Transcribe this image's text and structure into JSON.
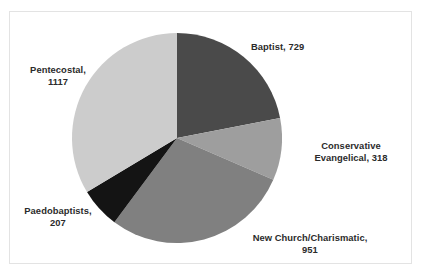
{
  "chart_data": {
    "type": "pie",
    "title": "",
    "subtitle": "",
    "xlabel": "",
    "ylabel": "",
    "legend_position": "none",
    "grid": false,
    "label_format": "{category}, {value}",
    "total": 3322,
    "start_angle_deg": 0,
    "direction": "clockwise",
    "categories": [
      "Baptist",
      "Conservative Evangelical",
      "New Church/Charismatic",
      "Paedobaptists",
      "Pentecostal"
    ],
    "values": [
      729,
      318,
      951,
      207,
      1117
    ],
    "slices": [
      {
        "category": "Baptist",
        "value": 729,
        "label": "Baptist, 729",
        "color": "#4a4a4a",
        "start_angle_deg": 0.0,
        "sweep_angle_deg": 79.0,
        "percent": 21.9
      },
      {
        "category": "Conservative Evangelical",
        "value": 318,
        "label": "Conservative Evangelical, 318",
        "label_line1": "Conservative",
        "label_line2": "Evangelical, 318",
        "color": "#9e9e9e",
        "start_angle_deg": 79.0,
        "sweep_angle_deg": 34.5,
        "percent": 9.6
      },
      {
        "category": "New Church/Charismatic",
        "value": 951,
        "label": "New Church/Charismatic, 951",
        "label_line1": "New Church/Charismatic,",
        "label_line2": "951",
        "color": "#808080",
        "start_angle_deg": 113.5,
        "sweep_angle_deg": 103.1,
        "percent": 28.6
      },
      {
        "category": "Paedobaptists",
        "value": 207,
        "label": "Paedobaptists, 207",
        "label_line1": "Paedobaptists,",
        "label_line2": "207",
        "color": "#141414",
        "start_angle_deg": 216.6,
        "sweep_angle_deg": 22.4,
        "percent": 6.2
      },
      {
        "category": "Pentecostal",
        "value": 1117,
        "label": "Pentecostal, 1117",
        "label_line1": "Pentecostal,",
        "label_line2": "1117",
        "color": "#cccccc",
        "start_angle_deg": 239.0,
        "sweep_angle_deg": 121.0,
        "percent": 33.6
      }
    ]
  },
  "labels": {
    "baptist": "Baptist, 729",
    "conservative_line1": "Conservative",
    "conservative_line2": "Evangelical, 318",
    "newchurch_line1": "New Church/Charismatic,",
    "newchurch_line2": "951",
    "paedobaptists_line1": "Paedobaptists,",
    "paedobaptists_line2": "207",
    "pentecostal_line1": "Pentecostal,",
    "pentecostal_line2": "1117"
  },
  "geometry": {
    "center_x": 177,
    "center_y": 138,
    "radius": 105
  },
  "colors": {
    "background": "#ffffff",
    "frame_border": "#e3e3e3",
    "label_text": "#2b2b2b"
  }
}
